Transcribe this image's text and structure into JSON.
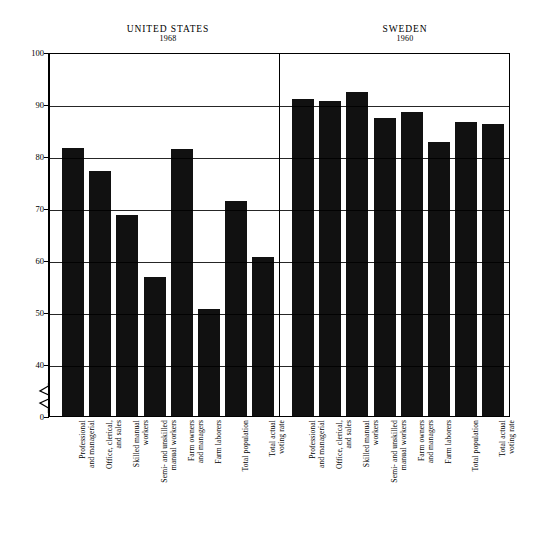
{
  "figure": {
    "panels": [
      {
        "country": "UNITED STATES",
        "year": "1968"
      },
      {
        "country": "SWEDEN",
        "year": "1960"
      }
    ]
  },
  "axis": {
    "y_ticks": [
      "100",
      "90",
      "80",
      "70",
      "60",
      "50",
      "40",
      "0"
    ],
    "break_icon": "axis-break-zigzag"
  },
  "chart_data": {
    "type": "bar",
    "title": "",
    "subtitle": "",
    "xlabel": "",
    "ylabel": "",
    "ylim": [
      40,
      100
    ],
    "y_ticks": [
      40,
      50,
      60,
      70,
      80,
      90,
      100
    ],
    "y_axis_break": true,
    "y_axis_break_between": [
      0,
      40
    ],
    "grid": true,
    "legend": "none",
    "panels": [
      {
        "name": "UNITED STATES",
        "year": "1968",
        "categories": [
          "Professional\nand managerial",
          "Office, clerical,\nand sales",
          "Skilled manual\nworkers",
          "Semi- and unskilled\nmanual workers",
          "Farm owners\nand managers",
          "Farm laborers",
          "Total population",
          "Total actual\nvoting rate"
        ],
        "values": [
          81.5,
          77.2,
          68.6,
          56.7,
          81.3,
          50.5,
          71.4,
          60.6
        ]
      },
      {
        "name": "SWEDEN",
        "year": "1960",
        "categories": [
          "Professional\nand managerial",
          "Office, clerical,\nand sales",
          "Skilled manual\nworkers",
          "Semi- and unskilled\nmanual workers",
          "Farm owners\nand managers",
          "Farm laborers",
          "Total population",
          "Total actual\nvoting rate"
        ],
        "values": [
          90.9,
          90.5,
          92.4,
          87.4,
          88.5,
          82.6,
          86.6,
          86.1
        ]
      }
    ]
  },
  "colors": {
    "bar": "#111111",
    "axis": "#000000",
    "background": "#ffffff"
  }
}
